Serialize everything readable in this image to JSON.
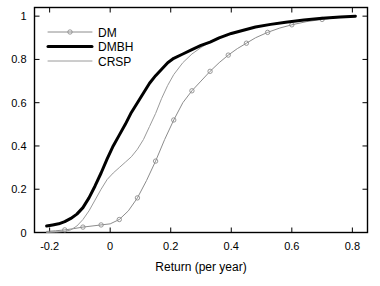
{
  "chart_data": {
    "type": "line",
    "title": "",
    "subtitle": "",
    "xlabel": "Return (per year)",
    "ylabel": "",
    "xlim": [
      -0.25,
      0.85
    ],
    "ylim": [
      0,
      1.04
    ],
    "grid": false,
    "legend_position": "upper-left",
    "xticks": [
      -0.2,
      0,
      0.2,
      0.4,
      0.6,
      0.8
    ],
    "xtick_labels": [
      "-0.2",
      "0",
      "0.2",
      "0.4",
      "0.6",
      "0.8"
    ],
    "yticks": [
      0,
      0.2,
      0.4,
      0.6,
      0.8,
      1
    ],
    "ytick_labels": [
      "0",
      "0.2",
      "0.4",
      "0.6",
      "0.8",
      "1"
    ],
    "series": [
      {
        "name": "DM",
        "color": "#8c8c8c",
        "width": 1,
        "marker": "circle",
        "x": [
          -0.21,
          -0.18,
          -0.15,
          -0.12,
          -0.09,
          -0.06,
          -0.03,
          0.0,
          0.03,
          0.06,
          0.09,
          0.12,
          0.15,
          0.18,
          0.21,
          0.24,
          0.27,
          0.3,
          0.33,
          0.36,
          0.39,
          0.42,
          0.45,
          0.48,
          0.52,
          0.56,
          0.6,
          0.65,
          0.7,
          0.76,
          0.81
        ],
        "y": [
          0.005,
          0.008,
          0.012,
          0.018,
          0.025,
          0.03,
          0.035,
          0.04,
          0.06,
          0.1,
          0.16,
          0.24,
          0.33,
          0.43,
          0.52,
          0.6,
          0.655,
          0.7,
          0.745,
          0.785,
          0.82,
          0.85,
          0.875,
          0.9,
          0.925,
          0.945,
          0.96,
          0.975,
          0.985,
          0.995,
          1.0
        ]
      },
      {
        "name": "DMBH",
        "color": "#000000",
        "width": 3,
        "marker": "none",
        "x": [
          -0.21,
          -0.19,
          -0.17,
          -0.15,
          -0.13,
          -0.11,
          -0.09,
          -0.07,
          -0.05,
          -0.03,
          -0.01,
          0.01,
          0.03,
          0.05,
          0.07,
          0.09,
          0.11,
          0.13,
          0.15,
          0.17,
          0.19,
          0.21,
          0.24,
          0.27,
          0.3,
          0.33,
          0.36,
          0.4,
          0.44,
          0.48,
          0.53,
          0.58,
          0.64,
          0.7,
          0.76,
          0.81
        ],
        "y": [
          0.03,
          0.035,
          0.04,
          0.05,
          0.065,
          0.085,
          0.115,
          0.16,
          0.215,
          0.275,
          0.34,
          0.4,
          0.45,
          0.5,
          0.555,
          0.6,
          0.645,
          0.69,
          0.725,
          0.755,
          0.785,
          0.805,
          0.825,
          0.845,
          0.865,
          0.88,
          0.9,
          0.92,
          0.935,
          0.95,
          0.962,
          0.972,
          0.982,
          0.99,
          0.996,
          1.0
        ]
      },
      {
        "name": "CRSP",
        "color": "#9a9a9a",
        "width": 1,
        "marker": "none",
        "x": [
          -0.21,
          -0.18,
          -0.15,
          -0.13,
          -0.11,
          -0.09,
          -0.07,
          -0.05,
          -0.03,
          -0.01,
          0.01,
          0.03,
          0.05,
          0.07,
          0.09,
          0.11,
          0.13,
          0.15,
          0.17,
          0.19,
          0.21,
          0.24,
          0.27,
          0.3,
          0.33,
          0.37,
          0.41,
          0.45,
          0.5,
          0.55,
          0.61,
          0.68,
          0.75,
          0.81
        ],
        "y": [
          0.0,
          0.002,
          0.005,
          0.012,
          0.03,
          0.06,
          0.1,
          0.15,
          0.2,
          0.245,
          0.275,
          0.3,
          0.325,
          0.35,
          0.385,
          0.43,
          0.49,
          0.55,
          0.62,
          0.68,
          0.73,
          0.785,
          0.825,
          0.855,
          0.88,
          0.905,
          0.925,
          0.94,
          0.955,
          0.968,
          0.978,
          0.988,
          0.995,
          1.0
        ]
      }
    ]
  },
  "legend": {
    "entries": [
      {
        "label": "DM"
      },
      {
        "label": "DMBH"
      },
      {
        "label": "CRSP"
      }
    ]
  },
  "axes": {
    "x_title": "Return (per year)"
  }
}
